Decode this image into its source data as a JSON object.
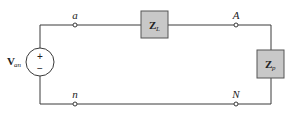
{
  "diagram": {
    "type": "circuit",
    "source": {
      "label_main": "V",
      "label_sub": "an",
      "plus": "+",
      "minus": "−"
    },
    "nodes": {
      "a": "a",
      "A": "A",
      "n": "n",
      "N": "N"
    },
    "impedances": {
      "line": {
        "main": "Z",
        "sub": "L"
      },
      "load": {
        "main": "Z",
        "sub": "p"
      }
    },
    "colors": {
      "wire": "#3a3a3a",
      "box_fill": "#c8c8c8",
      "box_stroke": "#555555",
      "background": "#ffffff"
    }
  }
}
